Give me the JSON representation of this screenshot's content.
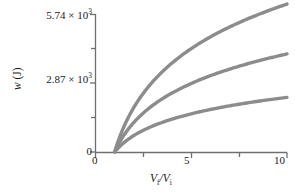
{
  "chart_data": {
    "type": "line",
    "title": "",
    "subtitle": "",
    "xlabel": "Vf/Vi",
    "ylabel": "w (J)",
    "xlim": [
      0,
      10
    ],
    "ylim": [
      0,
      5740
    ],
    "grid": false,
    "legend": "none",
    "x_ticks": [
      0,
      2.5,
      5,
      7.5,
      10
    ],
    "x_tick_labels": [
      "0",
      "",
      "5",
      "",
      "10"
    ],
    "y_ticks": [
      0,
      1435,
      2870,
      4305,
      5740
    ],
    "y_tick_labels": [
      "0",
      "",
      "2.87 × 10³",
      "",
      "5.74 × 10³"
    ],
    "curve_color": "#8c8c8c",
    "axis_color": "#6f6f72",
    "x": [
      1,
      1.3,
      1.6,
      2,
      2.5,
      3,
      3.5,
      4,
      5,
      6,
      7,
      8,
      9,
      10
    ],
    "series": [
      {
        "name": "upper-curve",
        "values": [
          0,
          650,
          1175,
          1730,
          2285,
          2740,
          3125,
          3460,
          4015,
          4465,
          4850,
          5185,
          5480,
          5740
        ]
      },
      {
        "name": "middle-curve",
        "values": [
          0,
          430,
          780,
          1145,
          1515,
          1815,
          2070,
          2295,
          2660,
          2960,
          3215,
          3435,
          3630,
          3805
        ]
      },
      {
        "name": "lower-curve",
        "values": [
          0,
          240,
          435,
          640,
          845,
          1015,
          1155,
          1280,
          1485,
          1650,
          1795,
          1915,
          2025,
          2120
        ]
      }
    ]
  },
  "axis_labels": {
    "y_top": "5.74 × 10",
    "y_top_exp": "3",
    "y_mid": "2.87 × 10",
    "y_mid_exp": "3",
    "y_zero": "0",
    "x_zero": "0",
    "x_five": "5",
    "x_ten": "10",
    "y_title_main": "w",
    "y_title_unit": " (J)",
    "x_title_num": "V",
    "x_title_num_sub": "f",
    "x_title_slash": "/V",
    "x_title_den_sub": "i"
  }
}
